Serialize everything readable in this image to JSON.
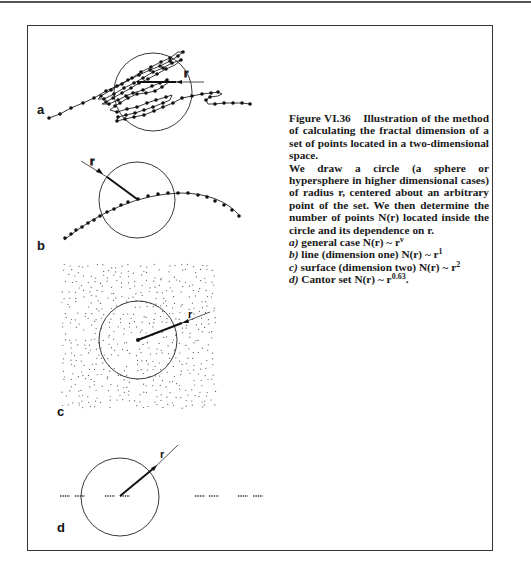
{
  "figure": {
    "number": "Figure VI.36",
    "title": "Illustration of the method of calculating the fractal dimension of a set of points located in a two-dimensional space.",
    "description_lines": [
      "We draw a circle (a sphere or hypersphere in higher dimensional cases) of radius r, centered about an arbitrary point of the set. We then determine the number of points N(r) located inside the circle and its dependence on r."
    ],
    "items": [
      {
        "label": "a)",
        "text": "general case",
        "formula_base": "N(r) ~ r",
        "exponent": "ν"
      },
      {
        "label": "b)",
        "text": "line (dimension one)",
        "formula_base": "N(r) ~ r",
        "exponent": "1"
      },
      {
        "label": "c)",
        "text": "surface (dimension two)",
        "formula_base": "N(r) ~ r",
        "exponent": "2"
      },
      {
        "label": "d)",
        "text": "Cantor set",
        "formula_base": "N(r) ~ r",
        "exponent": "0.63",
        "suffix": "."
      }
    ]
  },
  "panels": [
    {
      "id": "a",
      "label": "a",
      "radius_label": "r",
      "kind": "random walk (general fractal)"
    },
    {
      "id": "b",
      "label": "b",
      "radius_label": "r",
      "kind": "line"
    },
    {
      "id": "c",
      "label": "c",
      "radius_label": "r",
      "kind": "surface"
    },
    {
      "id": "d",
      "label": "d",
      "radius_label": "r",
      "kind": "Cantor set"
    }
  ]
}
